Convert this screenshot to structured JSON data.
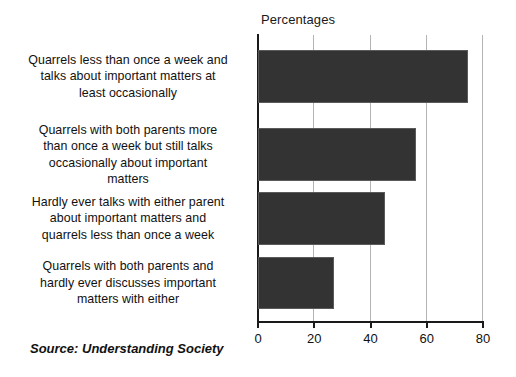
{
  "chart_data": {
    "type": "bar",
    "orientation": "horizontal",
    "title": "Percentages",
    "xlabel": "",
    "ylabel": "",
    "xlim": [
      0,
      80
    ],
    "ticks": [
      "0",
      "20",
      "40",
      "60",
      "80"
    ],
    "tick_values": [
      0,
      20,
      40,
      60,
      80
    ],
    "grid": true,
    "legend": "none",
    "bar_color": "#333333",
    "axis_color": "#1a1a1a",
    "gridline_color": "#b4b4b4",
    "categories": [
      "Quarrels less than once a week and talks about important matters at least occasionally",
      "Quarrels with both parents more than once a week but still talks occasionally about important matters",
      "Hardly ever talks with either parent about important matters and quarrels less than once a week",
      "Quarrels with both parents and hardly ever discusses important matters with either"
    ],
    "category_lines": [
      [
        "Quarrels less than once a week and",
        "talks about important matters at",
        "least occasionally"
      ],
      [
        "Quarrels with both parents more",
        "than once a week but still talks",
        "occasionally about important",
        "matters"
      ],
      [
        "Hardly ever talks with either parent",
        "about important matters and",
        "quarrels less than once a week"
      ],
      [
        "Quarrels with both parents and",
        "hardly ever discusses important",
        "matters with either"
      ]
    ],
    "values": [
      74.5,
      56,
      45,
      27
    ],
    "source": "Source: Understanding Society"
  }
}
